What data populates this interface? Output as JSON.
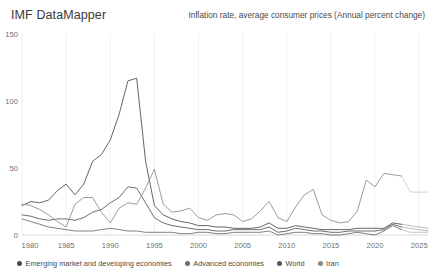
{
  "header": {
    "brand": "IMF DataMapper",
    "subtitle": "Inflation rate, average consumer prices (Annual percent change)"
  },
  "legend": {
    "items": [
      {
        "label": "Emerging market and developing economies",
        "color": "#4a4a4a"
      },
      {
        "label": "Advanced economies",
        "color": "#6b6b6b"
      },
      {
        "label": "World",
        "color": "#555555"
      },
      {
        "label": "Iran",
        "color": "#8a8a8a"
      }
    ]
  },
  "chart_data": {
    "type": "line",
    "title": "Inflation rate, average consumer prices (Annual percent change)",
    "xlabel": "",
    "ylabel": "",
    "xlim": [
      1980,
      2026
    ],
    "ylim": [
      0,
      150
    ],
    "yticks": [
      0,
      50,
      100,
      150
    ],
    "xticks": [
      1980,
      1985,
      1990,
      1995,
      2000,
      2005,
      2010,
      2015,
      2020,
      2025
    ],
    "grid": "vertical",
    "legend_position": "bottom",
    "projection_start": 2023,
    "x": [
      1980,
      1981,
      1982,
      1983,
      1984,
      1985,
      1986,
      1987,
      1988,
      1989,
      1990,
      1991,
      1992,
      1993,
      1994,
      1995,
      1996,
      1997,
      1998,
      1999,
      2000,
      2001,
      2002,
      2003,
      2004,
      2005,
      2006,
      2007,
      2008,
      2009,
      2010,
      2011,
      2012,
      2013,
      2014,
      2015,
      2016,
      2017,
      2018,
      2019,
      2020,
      2021,
      2022,
      2023,
      2024,
      2025,
      2026
    ],
    "series": [
      {
        "name": "Emerging market and developing economies",
        "color": "#4a4a4a",
        "values": [
          22,
          25,
          24,
          26,
          33,
          38,
          30,
          38,
          55,
          60,
          71,
          90,
          115,
          117,
          55,
          22,
          15,
          12,
          10,
          9,
          7,
          7,
          6,
          6,
          5,
          5,
          5,
          6,
          9,
          5,
          5,
          7,
          6,
          5,
          4,
          4,
          4,
          4,
          5,
          5,
          5,
          5,
          9,
          8,
          7,
          6,
          5
        ]
      },
      {
        "name": "Advanced economies",
        "color": "#6b6b6b",
        "values": [
          12,
          10,
          8,
          6,
          5,
          4,
          3,
          3,
          3,
          4,
          5,
          4,
          3,
          3,
          2,
          2,
          2,
          2,
          1,
          1,
          2,
          2,
          1,
          1,
          2,
          2,
          2,
          2,
          3,
          0,
          1,
          2,
          2,
          1,
          1,
          0,
          0,
          1,
          2,
          1,
          0,
          3,
          7,
          4,
          2,
          2,
          2
        ]
      },
      {
        "name": "World",
        "color": "#555555",
        "values": [
          15,
          14,
          12,
          11,
          12,
          12,
          11,
          13,
          17,
          19,
          24,
          28,
          36,
          35,
          24,
          13,
          9,
          7,
          6,
          5,
          4,
          4,
          3,
          3,
          4,
          4,
          4,
          4,
          6,
          2,
          3,
          5,
          4,
          3,
          3,
          2,
          2,
          3,
          3,
          3,
          3,
          4,
          8,
          6,
          5,
          4,
          3
        ]
      },
      {
        "name": "Iran",
        "color": "#8a8a8a",
        "values": [
          23,
          22,
          19,
          15,
          10,
          6,
          23,
          28,
          28,
          17,
          9,
          20,
          24,
          23,
          35,
          49,
          23,
          17,
          18,
          20,
          13,
          11,
          15,
          16,
          15,
          10,
          12,
          18,
          25,
          13,
          10,
          21,
          30,
          34,
          15,
          11,
          9,
          10,
          18,
          41,
          36,
          46,
          45,
          44,
          32,
          32,
          32
        ]
      }
    ]
  }
}
